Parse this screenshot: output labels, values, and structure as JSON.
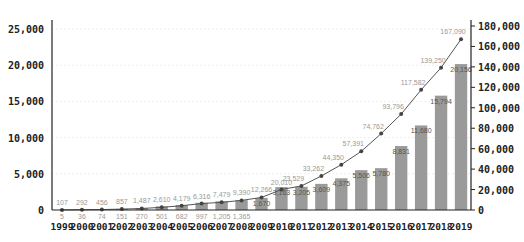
{
  "chart_data": {
    "type": "bar+line",
    "title": "",
    "categories": [
      "1999",
      "2000",
      "2001",
      "2002",
      "2003",
      "2004",
      "2005",
      "2006",
      "2007",
      "2008",
      "2009",
      "2010",
      "2011",
      "2012",
      "2013",
      "2014",
      "2015",
      "2016",
      "2017",
      "2018",
      "2019"
    ],
    "series": [
      {
        "name": "bars (left axis)",
        "type": "bar",
        "axis": "left",
        "color": "#9a9a9a",
        "values": [
          5,
          36,
          74,
          151,
          270,
          501,
          682,
          997,
          1205,
          1365,
          1670,
          3163,
          3205,
          3609,
          4375,
          5506,
          5780,
          8831,
          11680,
          15794,
          20156
        ],
        "labels": [
          "5",
          "36",
          "74",
          "151",
          "270",
          "501",
          "682",
          "997",
          "1,205",
          "1,365",
          "1,670",
          "3,163",
          "3,205",
          "3,609",
          "4,375",
          "5,506",
          "5,780",
          "8,831",
          "11,680",
          "15,794",
          "20,156"
        ]
      },
      {
        "name": "line (right axis)",
        "type": "line",
        "axis": "right",
        "color": "#555555",
        "values": [
          107,
          292,
          456,
          857,
          1487,
          2610,
          4179,
          6316,
          7479,
          9390,
          12266,
          20010,
          23529,
          33262,
          44350,
          57391,
          74762,
          93796,
          117582,
          139250,
          167090
        ],
        "labels": [
          "107",
          "292",
          "456",
          "857",
          "1,487",
          "2,610",
          "4,179",
          "6,316",
          "7,479",
          "9,390",
          "12,266",
          "20,010",
          "23,529",
          "33,262",
          "44,350",
          "57,391",
          "74,762",
          "93,796",
          "117,582",
          "139,250",
          "167,090"
        ]
      }
    ],
    "left_axis": {
      "ylim": [
        0,
        25000
      ],
      "ticks": [
        "0",
        "5,000",
        "10,000",
        "15,000",
        "20,000",
        "25,000"
      ],
      "values": [
        0,
        5000,
        10000,
        15000,
        20000,
        25000
      ]
    },
    "right_axis": {
      "ylim": [
        0,
        180000
      ],
      "ticks": [
        "0",
        "20,000",
        "40,000",
        "60,000",
        "80,000",
        "100,000",
        "120,000",
        "140,000",
        "160,000",
        "180,000"
      ],
      "values": [
        0,
        20000,
        40000,
        60000,
        80000,
        100000,
        120000,
        140000,
        160000,
        180000
      ]
    },
    "xlabel": "",
    "ylabel": "",
    "grid": true,
    "legend": "none"
  }
}
